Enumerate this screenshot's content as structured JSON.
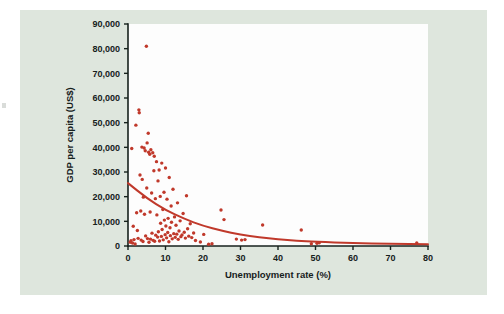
{
  "figure": {
    "background_color": "#dee6dd",
    "plot_background_color": "#fdfdfd",
    "accent_color": "#c0392b",
    "axis_color": "#16211c"
  },
  "chart_data": {
    "type": "scatter",
    "title": "",
    "xlabel": "Unemployment rate (%)",
    "ylabel": "GDP per capita (US$)",
    "xlim": [
      0,
      80
    ],
    "ylim": [
      0,
      90000
    ],
    "xticks": [
      0,
      10,
      20,
      30,
      40,
      50,
      60,
      70,
      80
    ],
    "xtick_labels": [
      "0",
      "10",
      "20",
      "30",
      "40",
      "50",
      "60",
      "70",
      "80"
    ],
    "yticks": [
      0,
      10000,
      20000,
      30000,
      40000,
      50000,
      60000,
      70000,
      80000,
      90000
    ],
    "ytick_labels": [
      "0",
      "10,000",
      "20,000",
      "30,000",
      "40,000",
      "50,000",
      "60,000",
      "70,000",
      "80,000",
      "90,000"
    ],
    "grid": false,
    "legend": "none",
    "series": [
      {
        "name": "Countries",
        "marker": "circle",
        "color": "#c0392b",
        "points": [
          [
            0.6,
            1500
          ],
          [
            0.8,
            2100
          ],
          [
            1.0,
            39500
          ],
          [
            1.2,
            1200
          ],
          [
            1.4,
            8000
          ],
          [
            1.6,
            2600
          ],
          [
            1.9,
            800
          ],
          [
            2.1,
            49000
          ],
          [
            2.3,
            13500
          ],
          [
            2.5,
            6300
          ],
          [
            2.7,
            3100
          ],
          [
            2.9,
            55200
          ],
          [
            3.0,
            54000
          ],
          [
            3.2,
            28800
          ],
          [
            3.4,
            14200
          ],
          [
            3.5,
            2400
          ],
          [
            3.7,
            40100
          ],
          [
            3.8,
            27000
          ],
          [
            4.0,
            1800
          ],
          [
            4.1,
            19800
          ],
          [
            4.3,
            39700
          ],
          [
            4.4,
            12900
          ],
          [
            4.6,
            38600
          ],
          [
            4.7,
            4100
          ],
          [
            4.9,
            81000
          ],
          [
            5.0,
            23500
          ],
          [
            5.1,
            41800
          ],
          [
            5.2,
            3000
          ],
          [
            5.4,
            45700
          ],
          [
            5.5,
            38000
          ],
          [
            5.6,
            1500
          ],
          [
            5.8,
            37200
          ],
          [
            5.9,
            13800
          ],
          [
            6.0,
            2800
          ],
          [
            6.1,
            39000
          ],
          [
            6.3,
            21500
          ],
          [
            6.4,
            5200
          ],
          [
            6.6,
            37800
          ],
          [
            6.7,
            2300
          ],
          [
            6.9,
            30500
          ],
          [
            7.0,
            36400
          ],
          [
            7.1,
            1900
          ],
          [
            7.3,
            19200
          ],
          [
            7.4,
            4400
          ],
          [
            7.6,
            34200
          ],
          [
            7.7,
            12600
          ],
          [
            7.9,
            3600
          ],
          [
            8.0,
            26400
          ],
          [
            8.1,
            5800
          ],
          [
            8.3,
            30800
          ],
          [
            8.4,
            2000
          ],
          [
            8.6,
            20100
          ],
          [
            8.7,
            9200
          ],
          [
            8.9,
            3900
          ],
          [
            9.0,
            33600
          ],
          [
            9.1,
            6700
          ],
          [
            9.3,
            14800
          ],
          [
            9.4,
            2500
          ],
          [
            9.6,
            21800
          ],
          [
            9.7,
            10500
          ],
          [
            9.9,
            4600
          ],
          [
            10.0,
            31600
          ],
          [
            10.1,
            8100
          ],
          [
            10.3,
            3300
          ],
          [
            10.4,
            19000
          ],
          [
            10.6,
            5500
          ],
          [
            10.7,
            11200
          ],
          [
            10.9,
            1700
          ],
          [
            11.0,
            27800
          ],
          [
            11.2,
            7400
          ],
          [
            11.3,
            4200
          ],
          [
            11.5,
            16200
          ],
          [
            11.6,
            9600
          ],
          [
            11.8,
            2900
          ],
          [
            12.0,
            23000
          ],
          [
            12.2,
            5000
          ],
          [
            12.4,
            11800
          ],
          [
            12.6,
            3500
          ],
          [
            12.8,
            8400
          ],
          [
            13.0,
            4800
          ],
          [
            13.2,
            17500
          ],
          [
            13.4,
            2700
          ],
          [
            13.6,
            6100
          ],
          [
            13.9,
            10200
          ],
          [
            14.1,
            3800
          ],
          [
            14.4,
            4500
          ],
          [
            14.7,
            13200
          ],
          [
            15.0,
            5600
          ],
          [
            15.3,
            3200
          ],
          [
            15.6,
            20400
          ],
          [
            15.9,
            7000
          ],
          [
            16.2,
            4000
          ],
          [
            16.6,
            9000
          ],
          [
            17.0,
            3400
          ],
          [
            17.5,
            5300
          ],
          [
            18.0,
            2200
          ],
          [
            19.3,
            1600
          ],
          [
            20.2,
            4700
          ],
          [
            21.5,
            700
          ],
          [
            22.4,
            900
          ],
          [
            24.8,
            14600
          ],
          [
            25.6,
            10700
          ],
          [
            28.9,
            2800
          ],
          [
            30.3,
            2400
          ],
          [
            31.2,
            2600
          ],
          [
            35.9,
            8500
          ],
          [
            46.2,
            6500
          ],
          [
            48.9,
            900
          ],
          [
            50.4,
            1100
          ],
          [
            51.0,
            1300
          ],
          [
            77.0,
            1200
          ]
        ]
      }
    ],
    "trend": {
      "name": "Exponential fit",
      "color": "#c0392b",
      "description": "Decaying exponential trend line through the scatter",
      "points": [
        [
          0,
          25500
        ],
        [
          5,
          19400
        ],
        [
          10,
          14600
        ],
        [
          15,
          11000
        ],
        [
          20,
          8200
        ],
        [
          25,
          6200
        ],
        [
          30,
          4600
        ],
        [
          35,
          3500
        ],
        [
          40,
          2700
        ],
        [
          45,
          2100
        ],
        [
          50,
          1700
        ],
        [
          60,
          1200
        ],
        [
          70,
          900
        ],
        [
          80,
          700
        ]
      ]
    }
  }
}
